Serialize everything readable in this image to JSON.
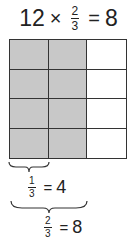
{
  "title_equation": {
    "whole": "12",
    "times": "×",
    "numerator": "2",
    "denominator": "3",
    "equals": "=",
    "result": "8"
  },
  "grid": {
    "rows": 4,
    "columns": 3,
    "shaded_columns": 2,
    "shade_color": "#c8c8c8",
    "line_color": "#333333"
  },
  "label_one_third": {
    "numerator": "1",
    "denominator": "3",
    "equals": "=",
    "value": "4"
  },
  "label_two_thirds": {
    "numerator": "2",
    "denominator": "3",
    "equals": "=",
    "value": "8"
  }
}
